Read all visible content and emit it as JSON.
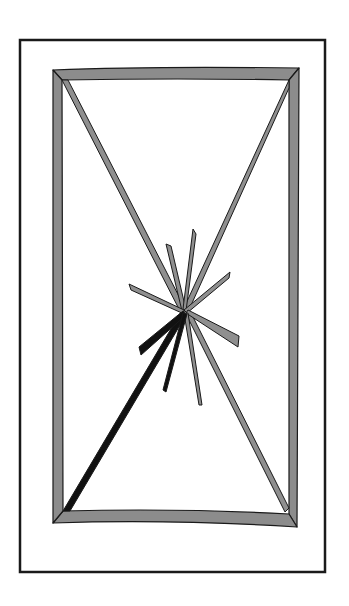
{
  "illustration": {
    "subject": "shattered window",
    "colors": {
      "background": "#ffffff",
      "outline": "#1a1a1a",
      "frame_fill": "#8c8c8c",
      "shard_fill": "#8f8f8f",
      "dark_crack": "#111111"
    }
  }
}
